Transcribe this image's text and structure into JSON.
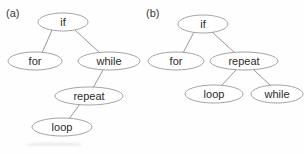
{
  "figure": {
    "type": "diagram",
    "background_color": "#fefefe",
    "node_fill_color": "#ffffff",
    "node_stroke_color": "#9a9a9a",
    "edge_color": "#8c8c8c",
    "text_color": "#2b2b2b"
  },
  "panels": [
    {
      "id": "a",
      "label": "(a)",
      "label_pos": {
        "x": 6,
        "y": 7
      },
      "nodes": [
        {
          "id": "a-if",
          "label": "if",
          "cx": 63,
          "cy": 22,
          "rx": 25,
          "ry": 9
        },
        {
          "id": "a-for",
          "label": "for",
          "cx": 35,
          "cy": 61,
          "rx": 27,
          "ry": 9
        },
        {
          "id": "a-while",
          "label": "while",
          "cx": 109,
          "cy": 61,
          "rx": 31,
          "ry": 9
        },
        {
          "id": "a-repeat",
          "label": "repeat",
          "cx": 89,
          "cy": 96,
          "rx": 34,
          "ry": 9
        },
        {
          "id": "a-loop",
          "label": "loop",
          "cx": 62,
          "cy": 127,
          "rx": 30,
          "ry": 9
        }
      ],
      "edges": [
        {
          "from": "a-if",
          "to": "a-for",
          "x1": 52,
          "y1": 30,
          "x2": 42,
          "y2": 53
        },
        {
          "from": "a-if",
          "to": "a-while",
          "x1": 75,
          "y1": 30,
          "x2": 100,
          "y2": 53
        },
        {
          "from": "a-while",
          "to": "a-repeat",
          "x1": 103,
          "y1": 70,
          "x2": 93,
          "y2": 88
        },
        {
          "from": "a-repeat",
          "to": "a-loop",
          "x1": 80,
          "y1": 104,
          "x2": 69,
          "y2": 119
        }
      ]
    },
    {
      "id": "b",
      "label": "(b)",
      "label_pos": {
        "x": 146,
        "y": 7
      },
      "nodes": [
        {
          "id": "b-if",
          "label": "if",
          "cx": 203,
          "cy": 24,
          "rx": 25,
          "ry": 9
        },
        {
          "id": "b-for",
          "label": "for",
          "cx": 176,
          "cy": 61,
          "rx": 28,
          "ry": 9
        },
        {
          "id": "b-repeat",
          "label": "repeat",
          "cx": 244,
          "cy": 61,
          "rx": 34,
          "ry": 9
        },
        {
          "id": "b-loop",
          "label": "loop",
          "cx": 214,
          "cy": 94,
          "rx": 29,
          "ry": 9
        },
        {
          "id": "b-while",
          "label": "while",
          "cx": 277,
          "cy": 94,
          "rx": 26,
          "ry": 9
        }
      ],
      "edges": [
        {
          "from": "b-if",
          "to": "b-for",
          "x1": 194,
          "y1": 32,
          "x2": 183,
          "y2": 53
        },
        {
          "from": "b-if",
          "to": "b-repeat",
          "x1": 212,
          "y1": 32,
          "x2": 235,
          "y2": 53
        },
        {
          "from": "b-repeat",
          "to": "b-loop",
          "x1": 236,
          "y1": 70,
          "x2": 221,
          "y2": 86
        },
        {
          "from": "b-repeat",
          "to": "b-while",
          "x1": 254,
          "y1": 70,
          "x2": 271,
          "y2": 86
        }
      ]
    }
  ]
}
